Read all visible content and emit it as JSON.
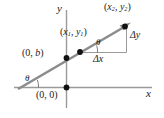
{
  "diagram": {
    "colors": {
      "line": "#8c8c8c",
      "axis": "#9a9a9a",
      "thin": "#9a9a9a",
      "point": "#111111",
      "text": "#1a1a1a",
      "background": "#ffffff"
    },
    "axes": {
      "x_label": "x",
      "y_label": "y"
    },
    "labels": {
      "point2": {
        "open": "(",
        "x": "x",
        "x_sub": "2",
        "comma": ", ",
        "y": "y",
        "y_sub": "2",
        "close": ")"
      },
      "point1": {
        "open": "(",
        "x": "x",
        "x_sub": "1",
        "comma": ", ",
        "y": "y",
        "y_sub": "1",
        "close": ")"
      },
      "delta_y": "Δy",
      "delta_x": "Δx",
      "intercept": {
        "open": "(",
        "zero": "0",
        "comma": ", ",
        "b": "b",
        "close": ")"
      },
      "origin": {
        "open": "(",
        "zero1": "0",
        "comma": ", ",
        "zero2": "0",
        "close": ")"
      },
      "theta_at_point1": "θ",
      "theta_at_xaxis": "θ"
    },
    "geometry": {
      "y_axis": {
        "x": 66,
        "y_top": 10,
        "y_bottom": 108
      },
      "x_axis": {
        "y": 87,
        "x_left": 14,
        "x_right": 152
      },
      "line": {
        "x1": 20,
        "y1": 88,
        "x2": 128,
        "y2": 25,
        "slope": 0.44
      },
      "points": [
        {
          "name": "origin",
          "x": 66,
          "y": 87
        },
        {
          "name": "y-intercept",
          "x": 66,
          "y": 58
        },
        {
          "name": "point1",
          "x": 80,
          "y": 52
        },
        {
          "name": "point2",
          "x": 126,
          "y": 26
        }
      ],
      "run_leg": {
        "x1": 80,
        "y1": 52,
        "x2": 126,
        "y2": 52
      },
      "rise_leg": {
        "x": 126,
        "y1": 52,
        "y2": 26
      }
    }
  }
}
